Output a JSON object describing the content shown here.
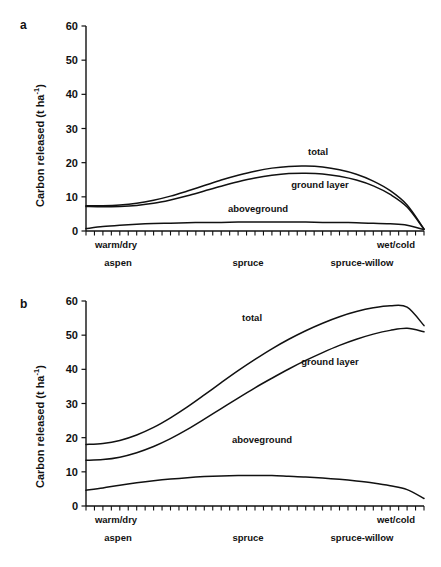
{
  "figure": {
    "panels": [
      {
        "letter": "a",
        "y_axis_label_main": "Carbon released (t ha",
        "y_axis_label_sup": "-1",
        "y_axis_label_tail": ")",
        "y_ticks": [
          "0",
          "10",
          "20",
          "30",
          "40",
          "50",
          "60"
        ],
        "x_end_labels": [
          "warm/dry",
          "wet/cold"
        ],
        "x_category_labels": [
          "aspen",
          "spruce",
          "spruce-willow"
        ],
        "series_labels": [
          "total",
          "ground layer",
          "aboveground"
        ]
      },
      {
        "letter": "b",
        "y_axis_label_main": "Carbon released (t ha",
        "y_axis_label_sup": "-1",
        "y_axis_label_tail": ")",
        "y_ticks": [
          "0",
          "10",
          "20",
          "30",
          "40",
          "50",
          "60"
        ],
        "x_end_labels": [
          "warm/dry",
          "wet/cold"
        ],
        "x_category_labels": [
          "aspen",
          "spruce",
          "spruce-willow"
        ],
        "series_labels": [
          "total",
          "ground layer",
          "aboveground"
        ]
      }
    ]
  },
  "chart_data": [
    {
      "type": "line",
      "panel": "a",
      "title": "",
      "xlabel": "",
      "ylabel": "Carbon released (t ha-1)",
      "ylim": [
        0,
        60
      ],
      "yticks": [
        0,
        10,
        20,
        30,
        40,
        50,
        60
      ],
      "grid": false,
      "legend_position": "inline-annotations",
      "x_axis_type": "ordinal-gradient",
      "x_endpoint_labels": [
        "warm/dry",
        "wet/cold"
      ],
      "x_category_labels": [
        "aspen",
        "spruce",
        "spruce-willow"
      ],
      "x_minor_tick_count": 41,
      "x": [
        0,
        0.05,
        0.1,
        0.15,
        0.2,
        0.25,
        0.3,
        0.35,
        0.4,
        0.45,
        0.5,
        0.55,
        0.6,
        0.65,
        0.7,
        0.75,
        0.8,
        0.85,
        0.9,
        0.95,
        1.0
      ],
      "series": [
        {
          "name": "total",
          "values": [
            7.4,
            7.4,
            7.6,
            8.1,
            9.0,
            10.2,
            11.7,
            13.3,
            14.9,
            16.3,
            17.5,
            18.4,
            18.9,
            19.0,
            18.7,
            17.9,
            16.6,
            14.6,
            11.8,
            7.6,
            0.6
          ]
        },
        {
          "name": "ground layer",
          "values": [
            7.2,
            7.1,
            7.2,
            7.5,
            8.1,
            9.1,
            10.3,
            11.7,
            13.1,
            14.4,
            15.5,
            16.3,
            16.8,
            16.9,
            16.7,
            16.0,
            14.9,
            13.2,
            10.7,
            7.0,
            0.5
          ]
        },
        {
          "name": "aboveground",
          "values": [
            0.7,
            1.3,
            1.7,
            2.0,
            2.2,
            2.3,
            2.4,
            2.5,
            2.5,
            2.6,
            2.6,
            2.6,
            2.6,
            2.6,
            2.5,
            2.5,
            2.4,
            2.3,
            2.1,
            1.7,
            0.4
          ]
        }
      ]
    },
    {
      "type": "line",
      "panel": "b",
      "title": "",
      "xlabel": "",
      "ylabel": "Carbon released (t ha-1)",
      "ylim": [
        0,
        60
      ],
      "yticks": [
        0,
        10,
        20,
        30,
        40,
        50,
        60
      ],
      "grid": false,
      "legend_position": "inline-annotations",
      "x_axis_type": "ordinal-gradient",
      "x_endpoint_labels": [
        "warm/dry",
        "wet/cold"
      ],
      "x_category_labels": [
        "aspen",
        "spruce",
        "spruce-willow"
      ],
      "x_minor_tick_count": 41,
      "x": [
        0,
        0.05,
        0.1,
        0.15,
        0.2,
        0.25,
        0.3,
        0.35,
        0.4,
        0.45,
        0.5,
        0.55,
        0.6,
        0.65,
        0.7,
        0.75,
        0.8,
        0.85,
        0.9,
        0.95,
        1.0
      ],
      "series": [
        {
          "name": "total",
          "values": [
            18.0,
            18.3,
            19.2,
            20.8,
            23.0,
            25.8,
            29.0,
            32.5,
            36.1,
            39.6,
            42.9,
            46.0,
            48.8,
            51.3,
            53.5,
            55.4,
            56.9,
            58.0,
            58.6,
            58.2,
            52.8
          ]
        },
        {
          "name": "ground layer",
          "values": [
            13.4,
            13.6,
            14.3,
            15.6,
            17.4,
            19.7,
            22.4,
            25.4,
            28.5,
            31.6,
            34.6,
            37.4,
            40.1,
            42.6,
            44.9,
            47.0,
            48.8,
            50.3,
            51.4,
            52.0,
            51.0
          ]
        },
        {
          "name": "aboveground",
          "values": [
            4.6,
            5.3,
            6.1,
            6.8,
            7.4,
            7.9,
            8.3,
            8.6,
            8.8,
            8.9,
            8.9,
            8.9,
            8.7,
            8.5,
            8.2,
            7.8,
            7.3,
            6.7,
            5.9,
            4.8,
            2.2
          ]
        }
      ]
    }
  ]
}
